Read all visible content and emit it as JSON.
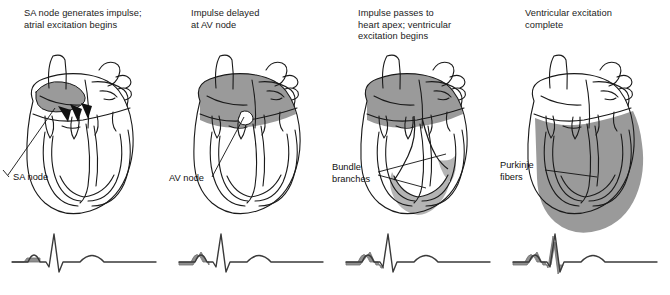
{
  "figure": {
    "colors": {
      "shade_gray": "#9a9a9a",
      "shade_gray_light": "#b4b4b4",
      "outline": "#1a1a1a",
      "background": "#ffffff",
      "ecg_trace": "#3a3a3a",
      "ecg_highlight": "#8f8f8f"
    }
  },
  "panels": [
    {
      "id": "panel-1",
      "caption": "SA node generates impulse;\natrial excitation begins",
      "label": "SA node",
      "shading": "sinoatrial-node-region-and-right-atrium",
      "arrows": 3,
      "ecg": {
        "highlight_segment": "pre-P-baseline",
        "waves": [
          "P",
          "QRS",
          "T"
        ]
      }
    },
    {
      "id": "panel-2",
      "caption": "Impulse delayed\nat AV node",
      "label": "AV node",
      "shading": "both-atria",
      "arrows": 0,
      "ecg": {
        "highlight_segment": "P-wave",
        "waves": [
          "P",
          "QRS",
          "T"
        ]
      }
    },
    {
      "id": "panel-3",
      "caption": "Impulse passes to\nheart apex; ventricular\nexcitation begins",
      "label": "Bundle\nbranches",
      "shading": "both-atria-plus-ventricular-apex",
      "arrows": 0,
      "ecg": {
        "highlight_segment": "P-wave-through-Q",
        "waves": [
          "P",
          "QRS",
          "T"
        ]
      }
    },
    {
      "id": "panel-4",
      "caption": "Ventricular excitation\ncomplete",
      "label": "Purkinje\nfibers",
      "shading": "both-ventricles",
      "arrows": 0,
      "ecg": {
        "highlight_segment": "P-through-QRS",
        "waves": [
          "P",
          "QRS",
          "T"
        ]
      }
    }
  ]
}
